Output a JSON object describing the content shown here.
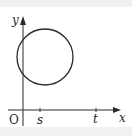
{
  "diagram": {
    "type": "coordinate-plane-with-circle",
    "colors": {
      "stroke": "#2a2a2a",
      "background": "#ffffff",
      "frame": "#f1f1f1"
    },
    "axes": {
      "x_label": "x",
      "y_label": "y",
      "origin_label": "O"
    },
    "ticks": [
      {
        "label": "s"
      },
      {
        "label": "t"
      }
    ],
    "circle": {
      "description": "circle in first quadrant crossing the y-axis, above the x-axis"
    }
  }
}
